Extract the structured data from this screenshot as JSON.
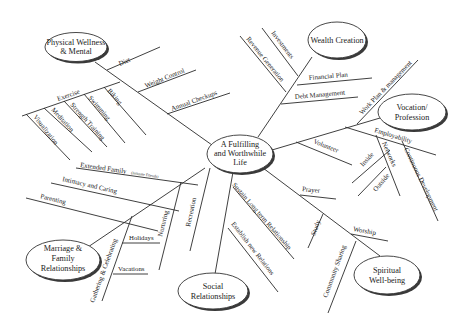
{
  "center": {
    "lines": [
      "A Fulfilling",
      "and Worthwhile",
      "Life"
    ]
  },
  "nodes": {
    "physical": {
      "lines": [
        "Physical Wellness",
        "& Mental"
      ]
    },
    "wealth": {
      "lines": [
        "Wealth Creation"
      ]
    },
    "vocation": {
      "lines": [
        "Vocation/",
        "Profession"
      ]
    },
    "marriage": {
      "lines": [
        "Marriage &",
        "Family",
        "Relationships"
      ]
    },
    "social": {
      "lines": [
        "Social",
        "Relationships"
      ]
    },
    "spiritual": {
      "lines": [
        "Spiritual",
        "Well-being"
      ]
    }
  },
  "branches": {
    "physical": [
      "Diet",
      "Weight Control",
      "Annual Checkups",
      "Exercise",
      "Biking",
      "Swimming",
      "Strength Training",
      "Meditation",
      "Visualization"
    ],
    "wealth": [
      "Investments",
      "Revenue Generation",
      "Financial Plan",
      "Debt Management"
    ],
    "vocation": [
      "Work Plan & management",
      "Employability",
      "Volunteer",
      "Inside",
      "Networks",
      "Outside",
      "Continuous Development"
    ],
    "marriage": [
      "Extended Family",
      "(Intimate Friends)",
      "Intimacy and Caring",
      "Parenting",
      "Holidays",
      "Vacations",
      "Gathering & Celebrating",
      "Nurturing",
      "Recreation"
    ],
    "social": [
      "Sustain Long term Relationship",
      "Establish new Relations"
    ],
    "spiritual": [
      "Prayer",
      "Study",
      "Worship",
      "Community Sharing"
    ]
  }
}
